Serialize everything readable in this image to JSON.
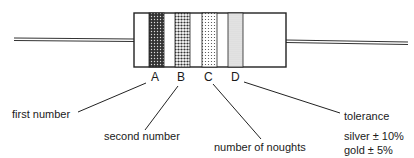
{
  "diagram": {
    "bands": [
      {
        "id": "A",
        "label": "A",
        "meaning": "first number",
        "pattern": "dense-dots"
      },
      {
        "id": "B",
        "label": "B",
        "meaning": "second number",
        "pattern": "medium-dots"
      },
      {
        "id": "C",
        "label": "C",
        "meaning": "number of noughts",
        "pattern": "light-dots"
      },
      {
        "id": "D",
        "label": "D",
        "meaning": "tolerance",
        "pattern": "fine-stipple"
      }
    ],
    "tolerance_values": [
      {
        "text": "silver ± 10%"
      },
      {
        "text": "gold ± 5%"
      }
    ]
  }
}
